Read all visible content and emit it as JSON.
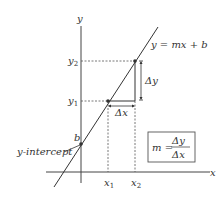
{
  "diagram": {
    "type": "slope-intercept-line",
    "axes": {
      "x_label": "x",
      "y_label": "y"
    },
    "line": {
      "equation": "y = mx + b",
      "color": "#333333"
    },
    "points": {
      "p1": {
        "x_label": "x",
        "x_sub": "1",
        "y_label": "y",
        "y_sub": "1"
      },
      "p2": {
        "x_label": "x",
        "x_sub": "2",
        "y_label": "y",
        "y_sub": "2"
      }
    },
    "intercept": {
      "point_label": "b",
      "callout": "y-intercept"
    },
    "deltas": {
      "dx": "Δx",
      "dy": "Δy"
    },
    "slope_box": {
      "lhs": "m =",
      "numerator": "Δy",
      "denominator": "Δx"
    },
    "colors": {
      "ink": "#333333",
      "dashed": "#555555",
      "background": "#ffffff"
    }
  }
}
